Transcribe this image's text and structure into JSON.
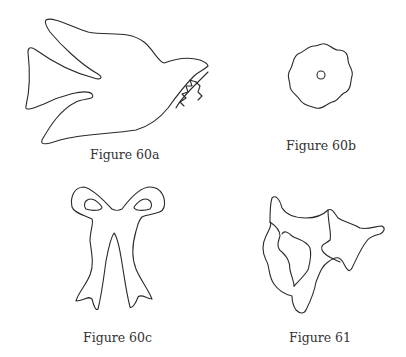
{
  "figures": [
    {
      "id": "60a",
      "caption": "Figure 60a",
      "subject": "dove with olive branch outline"
    },
    {
      "id": "60b",
      "caption": "Figure 60b",
      "subject": "scalloped round flower/rosette outline with center hole"
    },
    {
      "id": "60c",
      "caption": "Figure 60c",
      "subject": "ribbon bow outline"
    },
    {
      "id": "61",
      "caption": "Figure 61",
      "subject": "flower/bell blossoms outline"
    }
  ]
}
